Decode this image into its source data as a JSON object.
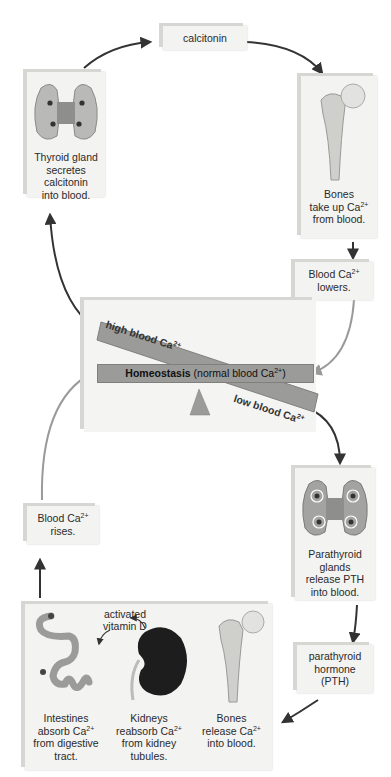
{
  "boxes": {
    "calcitonin": {
      "label": "calcitonin"
    },
    "thyroid": {
      "line1": "Thyroid gland",
      "line2": "secretes",
      "line3": "calcitonin",
      "line4": "into blood.",
      "icon": "thyroid-gland"
    },
    "bones_take_up": {
      "line1": "Bones",
      "line2a": "take up Ca",
      "sup": "2+",
      "line3": "from blood.",
      "icon": "femur-bone"
    },
    "blood_lowers": {
      "line1a": "Blood Ca",
      "sup": "2+",
      "line2": "lowers."
    },
    "parathyroid": {
      "line1": "Parathyroid",
      "line2": "glands",
      "line3": "release PTH",
      "line4": "into blood.",
      "icon": "parathyroid-glands"
    },
    "pth": {
      "line1": "parathyroid",
      "line2": "hormone",
      "line3": "(PTH)"
    },
    "blood_rises": {
      "line1a": "Blood Ca",
      "sup": "2+",
      "line2": "rises."
    },
    "effects": {
      "vitamin_d_line1": "activated",
      "vitamin_d_line2": "vitamin D",
      "items": [
        {
          "line1": "Intestines",
          "line2a": "absorb Ca",
          "sup": "2+",
          "line3": "from digestive",
          "line4": "tract.",
          "icon": "intestines"
        },
        {
          "line1": "Kidneys",
          "line2a": "reabsorb Ca",
          "sup": "2+",
          "line3": "from kidney",
          "line4": "tubules.",
          "icon": "kidney"
        },
        {
          "line1": "Bones",
          "line2a": "release Ca",
          "sup": "2+",
          "line3": "into blood.",
          "line4": "",
          "icon": "femur-bone"
        }
      ]
    }
  },
  "balance": {
    "high_label": "high blood Ca",
    "high_sup": "2+",
    "low_label": "low blood Ca",
    "low_sup": "2+",
    "homeostasis_bold": "Homeostasis",
    "homeostasis_rest": " (normal blood Ca",
    "homeostasis_sup": "2+",
    "homeostasis_end": ")"
  },
  "colors": {
    "beam": "#9b9b99",
    "panel": "#f3f3f1",
    "arrow_dark": "#333333",
    "arrow_light": "#9a9a9a",
    "kidney": "#1d1d1d"
  }
}
